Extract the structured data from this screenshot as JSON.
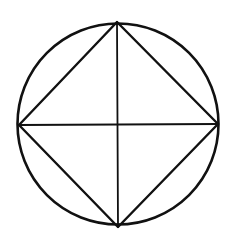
{
  "diagram": {
    "stroke_color": "#111111",
    "background": "#ffffff",
    "circle": {
      "cx": 118,
      "cy": 124,
      "r": 100.5
    },
    "square_vertices": {
      "top": [
        117,
        22
      ],
      "right": [
        218,
        124
      ],
      "bottom": [
        118,
        227
      ],
      "left": [
        19,
        125
      ]
    }
  }
}
